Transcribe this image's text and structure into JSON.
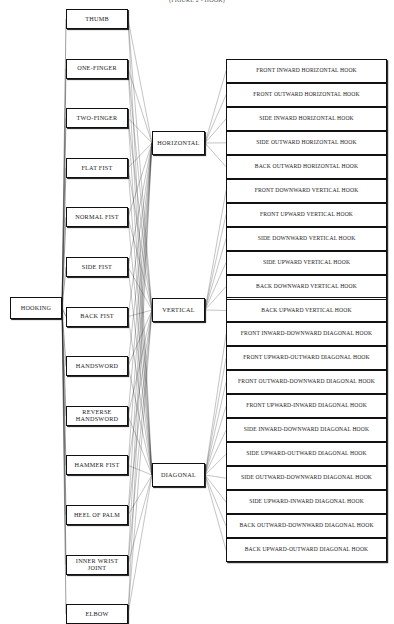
{
  "title": "(FIGURE 2 - HOOK)",
  "diagram": {
    "type": "hierarchy-tree",
    "orientation": "left-to-right",
    "root": {
      "label": "HOOKING"
    },
    "level1_label": "striking surface",
    "level2_label": "direction plane",
    "level3_label": "hook technique"
  },
  "root": {
    "label": "HOOKING"
  },
  "surfaces": [
    {
      "label": "THUMB"
    },
    {
      "label": "ONE-FINGER"
    },
    {
      "label": "TWO-FINGER"
    },
    {
      "label": "FLAT FIST"
    },
    {
      "label": "NORMAL FIST"
    },
    {
      "label": "SIDE FIST"
    },
    {
      "label": "BACK FIST"
    },
    {
      "label": "HANDSWORD"
    },
    {
      "label": "REVERSE HANDSWORD",
      "line1": "REVERSE",
      "line2": "HANDSWORD"
    },
    {
      "label": "HAMMER FIST"
    },
    {
      "label": "HEEL OF PALM"
    },
    {
      "label": "INNER WRIST JOINT",
      "line1": "INNER WRIST",
      "line2": "JOINT"
    },
    {
      "label": "ELBOW"
    }
  ],
  "planes": [
    {
      "label": "HORIZONTAL"
    },
    {
      "label": "VERTICAL"
    },
    {
      "label": "DIAGONAL"
    }
  ],
  "hooks": [
    {
      "label": "FRONT INWARD HORIZONTAL HOOK",
      "plane": "HORIZONTAL"
    },
    {
      "label": "FRONT OUTWARD HORIZONTAL HOOK",
      "plane": "HORIZONTAL"
    },
    {
      "label": "SIDE INWARD HORIZONTAL HOOK",
      "plane": "HORIZONTAL"
    },
    {
      "label": "SIDE OUTWARD HORIZONTAL HOOK",
      "plane": "HORIZONTAL"
    },
    {
      "label": "BACK OUTWARD HORIZONTAL HOOK",
      "plane": "HORIZONTAL"
    },
    {
      "label": "FRONT DOWNWARD VERTICAL HOOK",
      "plane": "VERTICAL"
    },
    {
      "label": "FRONT UPWARD VERTICAL HOOK",
      "plane": "VERTICAL"
    },
    {
      "label": "SIDE DOWNWARD VERTICAL HOOK",
      "plane": "VERTICAL"
    },
    {
      "label": "SIDE UPWARD VERTICAL HOOK",
      "plane": "VERTICAL"
    },
    {
      "label": "BACK DOWNWARD VERTICAL HOOK",
      "plane": "VERTICAL"
    },
    {
      "label": "BACK UPWARD VERTICAL HOOK",
      "plane": "VERTICAL"
    },
    {
      "label": "FRONT INWARD-DOWNWARD DIAGONAL HOOK",
      "plane": "DIAGONAL"
    },
    {
      "label": "FRONT UPWARD-OUTWARD DIAGONAL HOOK",
      "plane": "DIAGONAL"
    },
    {
      "label": "FRONT OUTWARD-DOWNWARD DIAGONAL HOOK",
      "plane": "DIAGONAL"
    },
    {
      "label": "FRONT UPWARD-INWARD DIAGONAL HOOK",
      "plane": "DIAGONAL"
    },
    {
      "label": "SIDE INWARD-DOWNWARD DIAGONAL HOOK",
      "plane": "DIAGONAL"
    },
    {
      "label": "SIDE UPWARD-OUTWARD DIAGONAL HOOK",
      "plane": "DIAGONAL"
    },
    {
      "label": "SIDE OUTWARD-DOWNWARD DIAGONAL HOOK",
      "plane": "DIAGONAL"
    },
    {
      "label": "SIDE UPWARD-INWARD DIAGONAL HOOK",
      "plane": "DIAGONAL"
    },
    {
      "label": "BACK OUTWARD-DOWNWARD DIAGONAL HOOK",
      "plane": "DIAGONAL"
    },
    {
      "label": "BACK UPWARD-OUTWARD DIAGONAL HOOK",
      "plane": "DIAGONAL"
    }
  ],
  "colors": {
    "line": "#111111",
    "shadow": "#2b2b2b",
    "background": "#ffffff",
    "text": "#1a1a1a"
  }
}
